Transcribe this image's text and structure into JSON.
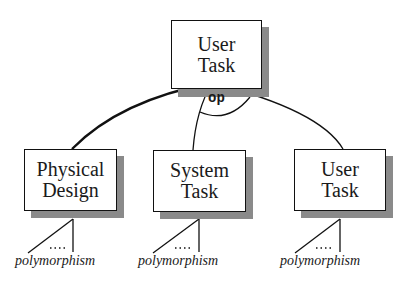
{
  "diagram": {
    "root": {
      "line1": "User",
      "line2": "Task"
    },
    "operator": "op",
    "children": [
      {
        "line1": "Physical",
        "line2": "Design",
        "footnote": "polymorphism",
        "ellipsis": "...."
      },
      {
        "line1": "System",
        "line2": "Task",
        "footnote": "polymorphism",
        "ellipsis": "...."
      },
      {
        "line1": "User",
        "line2": "Task",
        "footnote": "polymorphism",
        "ellipsis": "...."
      }
    ]
  }
}
